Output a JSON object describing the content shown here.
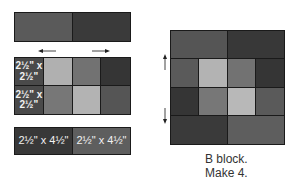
{
  "colors": {
    "light": "#b3b3b3",
    "medium": "#7a7a7a",
    "medium_dark": "#5e5e5e",
    "dark": "#474747",
    "darkest": "#373737",
    "label_dark": "#4a4a4a",
    "border": "#1a1a1a"
  },
  "top_strip": {
    "cells": [
      {
        "shade": "#5a5a5a"
      },
      {
        "shade": "#3a3a3a"
      }
    ]
  },
  "four_patch_strip": {
    "row1": [
      {
        "label": "2½\" x 2½\"",
        "shade": "#4a4a4a"
      },
      {
        "label": "",
        "shade": "#b0b0b0"
      },
      {
        "label": "",
        "shade": "#727272"
      },
      {
        "label": "",
        "shade": "#353535"
      }
    ],
    "row2": [
      {
        "label": "2½\" x 2½\"",
        "shade": "#4a4a4a"
      },
      {
        "label": "",
        "shade": "#777777"
      },
      {
        "label": "",
        "shade": "#b3b3b3"
      },
      {
        "label": "",
        "shade": "#555555"
      }
    ],
    "arrows": [
      "left",
      "right"
    ]
  },
  "bottom_strip": {
    "cells": [
      {
        "label": "2½\" x 4½\"",
        "shade": "#383838"
      },
      {
        "label": "2½\" x 4½\"",
        "shade": "#5e5e5e"
      }
    ]
  },
  "b_block": {
    "rows": [
      [
        "#555555",
        "#383838"
      ],
      [
        "#5a5a5a",
        "#b3b3b3",
        "#727272",
        "#353535"
      ],
      [
        "#353535",
        "#777777",
        "#b8b8b8",
        "#5a5a5a"
      ],
      [
        "#3a3a3a",
        "#5e5e5e"
      ]
    ],
    "arrows": [
      "up",
      "down"
    ]
  },
  "caption": {
    "line1": "B block.",
    "line2": "Make 4."
  }
}
